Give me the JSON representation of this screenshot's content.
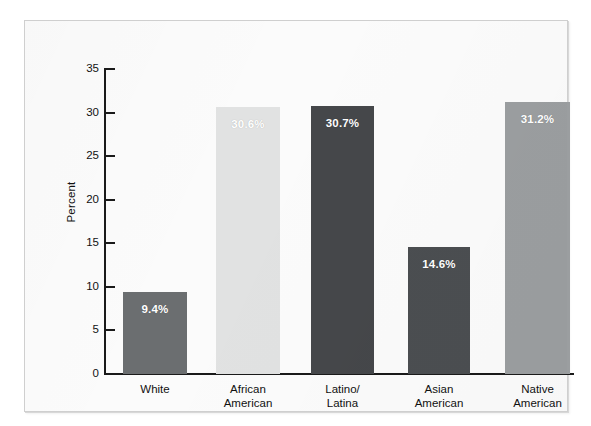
{
  "chart_data": {
    "type": "bar",
    "title": "",
    "subtitle": "",
    "xlabel": "",
    "ylabel": "Percent",
    "ylim": [
      0,
      35
    ],
    "yticks": [
      0,
      5,
      10,
      15,
      20,
      25,
      30,
      35
    ],
    "ytick_labels": [
      "0",
      "5",
      "10",
      "15",
      "20",
      "25",
      "30",
      "35"
    ],
    "grid": false,
    "legend": "none",
    "categories": [
      "White",
      "African American",
      "Latino/ Latina",
      "Asian American",
      "Native American"
    ],
    "category_lines": [
      [
        "White"
      ],
      [
        "African",
        "American"
      ],
      [
        "Latino/",
        "Latina"
      ],
      [
        "Asian",
        "American"
      ],
      [
        "Native",
        "American"
      ]
    ],
    "values": [
      9.4,
      30.6,
      30.7,
      14.6,
      31.2
    ],
    "value_labels": [
      "9.4%",
      "30.6%",
      "30.7%",
      "14.6%",
      "31.2%"
    ],
    "bar_colors": [
      "#6b6e70",
      "#e1e2e2",
      "#45474a",
      "#4b4e51",
      "#9b9ea0"
    ],
    "value_label_color": "#ffffff",
    "axis_color": "#1a1a1a",
    "plot_background": "#fbfbfb",
    "frame_border_color": "#cfcfcf"
  }
}
